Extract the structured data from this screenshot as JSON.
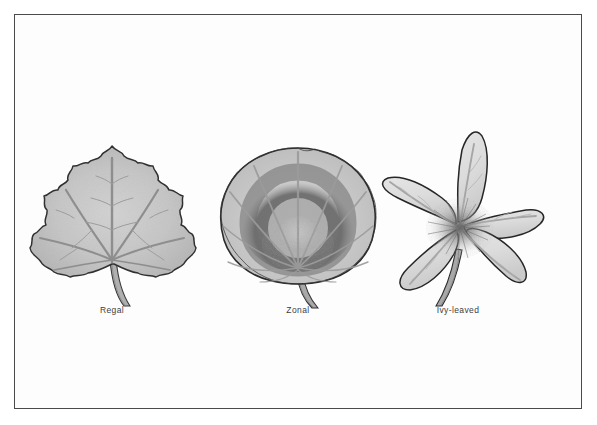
{
  "plate": {
    "type": "botanical-illustration",
    "subject": "Pelargonium leaf types",
    "rendering": "grayscale pen-and-ink with tonal wash",
    "background_color": "#ffffff",
    "frame": {
      "border_color": "#4a4a4a",
      "fill_color": "#fdfdfd"
    }
  },
  "specimens": [
    {
      "id": "regal",
      "label": "Regal",
      "shape": "palmate-lobed maple-like leaf",
      "margin": "serrated / toothed",
      "venation": "palmate radiating veins",
      "marking": "none",
      "body_color": "#c5c5c5",
      "vein_color": "#9a9a9a",
      "outline_color": "#2e2e2e",
      "stem": "curved, descending to lower right"
    },
    {
      "id": "zonal",
      "label": "Zonal",
      "shape": "rounded kidney / orbicular leaf",
      "margin": "crenate / scalloped",
      "venation": "palmate radiating veins",
      "marking": "dark horseshoe-shaped zone band",
      "body_color": "#c8c8c8",
      "zone_color": "#707070",
      "vein_color": "#8f8f8f",
      "outline_color": "#2b2b2b",
      "stem": "short thick, descending to lower right"
    },
    {
      "id": "ivy-leaved",
      "label": "Ivy-leaved",
      "shape": "five-pointed star, angular pointed lobes",
      "margin": "entire / smooth",
      "venation": "radiating from central point, finely stippled",
      "marking": "stippled radial hatching at centre",
      "body_color": "#dcdcdc",
      "vein_color": "#a5a5a5",
      "outline_color": "#262626",
      "stem": "straight, descending to lower left"
    }
  ],
  "captions": {
    "regal": "Regal",
    "zonal": "Zonal",
    "ivy": "Ivy-leaved"
  }
}
